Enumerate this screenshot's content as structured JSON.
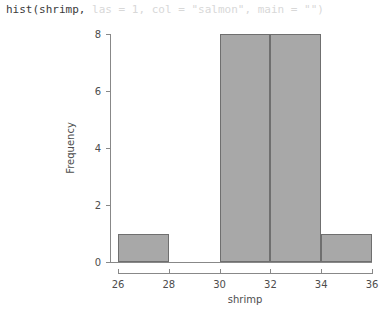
{
  "code": {
    "active_text": "hist(shrimp,",
    "faded_text": " las = 1, col = \"salmon\", main = \"\")",
    "full_text": "hist(shrimp, las = 1, col = \"salmon\", main = \"\")",
    "active_color": "#3b3b3b",
    "faded_color": "#d8d8d8"
  },
  "chart_data": {
    "type": "bar",
    "title": "",
    "xlabel": "shrimp",
    "ylabel": "Frequency",
    "xlim": [
      26,
      36
    ],
    "ylim": [
      0,
      8
    ],
    "xticks": [
      26,
      28,
      30,
      32,
      34,
      36
    ],
    "yticks": [
      0,
      2,
      4,
      6,
      8
    ],
    "xtick_labels": [
      "26",
      "28",
      "30",
      "32",
      "34",
      "36"
    ],
    "ytick_labels": [
      "0",
      "2",
      "4",
      "6",
      "8"
    ],
    "grid": false,
    "legend": false,
    "bin_width": 2,
    "bins": [
      {
        "label": "[26,28]",
        "x0": 26,
        "x1": 28,
        "value": 1
      },
      {
        "label": "(28,30]",
        "x0": 28,
        "x1": 30,
        "value": 0
      },
      {
        "label": "(30,32]",
        "x0": 30,
        "x1": 32,
        "value": 8
      },
      {
        "label": "(32,34]",
        "x0": 32,
        "x1": 34,
        "value": 8
      },
      {
        "label": "(34,36]",
        "x0": 34,
        "x1": 36,
        "value": 1
      }
    ],
    "categories": [
      "[26,28]",
      "(28,30]",
      "(30,32]",
      "(32,34]",
      "(34,36]"
    ],
    "values": [
      1,
      0,
      8,
      8,
      1
    ],
    "bar_fill_color": "#a8a8a8",
    "bar_border_color": "#6f6f6f",
    "axis_color": "#888888",
    "text_color": "#4d4d4d",
    "background_color": "#ffffff"
  }
}
